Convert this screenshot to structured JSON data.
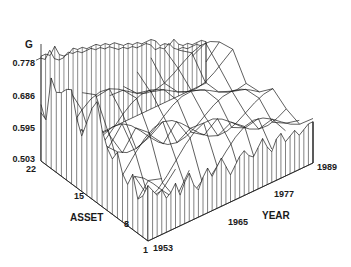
{
  "chart_data": {
    "type": "surface3d",
    "title": "",
    "zlabel": "G",
    "xlabel": "ASSET",
    "ylabel": "YEAR",
    "z_ticks": [
      "0.503",
      "0.595",
      "0.686",
      "0.778"
    ],
    "zlim": [
      0.503,
      0.778
    ],
    "asset_ticks": [
      "22",
      "15",
      "8",
      "1"
    ],
    "asset_range": [
      1,
      22
    ],
    "year_ticks": [
      "1953",
      "1965",
      "1977",
      "1989"
    ],
    "year_range": [
      1953,
      1989
    ],
    "front_left_wall_profile_asset_1953": [
      0.64,
      0.63,
      0.76,
      0.73,
      0.74,
      0.76,
      0.77,
      0.7,
      0.66,
      0.71,
      0.76,
      0.79,
      0.72,
      0.68,
      0.66,
      0.69,
      0.64,
      0.62,
      0.66,
      0.6,
      0.62,
      0.66
    ],
    "front_right_wall_profile_year_asset1": [
      0.66,
      0.64,
      0.62,
      0.63,
      0.6,
      0.61,
      0.63,
      0.59,
      0.62,
      0.64,
      0.6,
      0.58,
      0.61,
      0.63,
      0.6,
      0.62,
      0.64,
      0.61,
      0.58,
      0.6,
      0.62,
      0.63,
      0.61,
      0.6,
      0.62,
      0.64,
      0.61,
      0.59,
      0.62,
      0.63,
      0.6,
      0.61,
      0.62,
      0.6,
      0.61,
      0.62,
      0.62
    ],
    "back_wall_profile_year_asset22": [
      0.8,
      0.8,
      0.79,
      0.81,
      0.78,
      0.77,
      0.77,
      0.78,
      0.77,
      0.77,
      0.76,
      0.76,
      0.76,
      0.75,
      0.75,
      0.74,
      0.74,
      0.73,
      0.72,
      0.72,
      0.71,
      0.71,
      0.7,
      0.7,
      0.7,
      0.69,
      0.67,
      0.67,
      0.66,
      0.67,
      0.65,
      0.64,
      0.64,
      0.63,
      0.63,
      0.63,
      0.62
    ]
  },
  "colors": {
    "line": "#1a1a1a",
    "background": "#ffffff"
  }
}
